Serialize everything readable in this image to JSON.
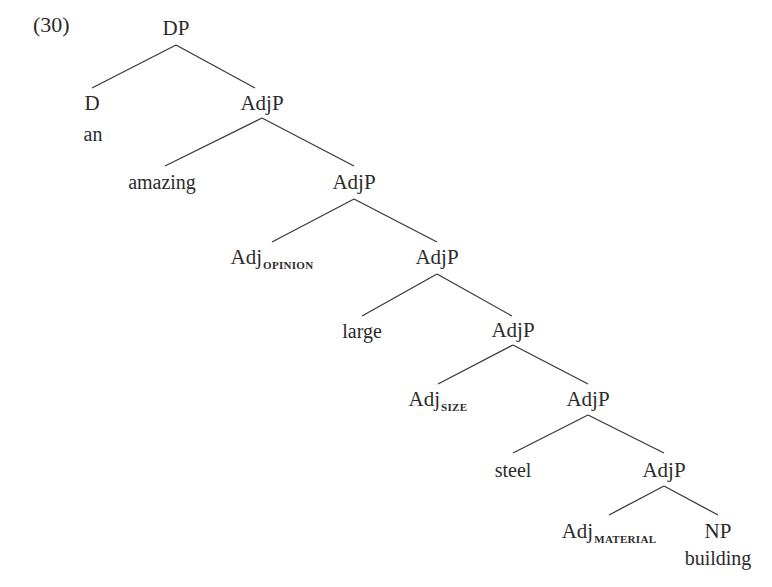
{
  "example_number": "(30)",
  "tree": {
    "nodes": {
      "dp": {
        "label": "DP"
      },
      "d": {
        "label": "D",
        "word": "an"
      },
      "adjp1": {
        "label": "AdjP"
      },
      "amazing": {
        "word": "amazing"
      },
      "adjp2": {
        "label": "AdjP"
      },
      "adj_opinion": {
        "label": "Adj",
        "subscript": "opinion"
      },
      "adjp3": {
        "label": "AdjP"
      },
      "large": {
        "word": "large"
      },
      "adjp4": {
        "label": "AdjP"
      },
      "adj_size": {
        "label": "Adj",
        "subscript": "size"
      },
      "adjp5": {
        "label": "AdjP"
      },
      "steel": {
        "word": "steel"
      },
      "adjp6": {
        "label": "AdjP"
      },
      "adj_material": {
        "label": "Adj",
        "subscript": "material"
      },
      "np": {
        "label": "NP",
        "word": "building"
      }
    },
    "edges": [
      [
        "dp",
        "d"
      ],
      [
        "dp",
        "adjp1"
      ],
      [
        "adjp1",
        "amazing"
      ],
      [
        "adjp1",
        "adjp2"
      ],
      [
        "adjp2",
        "adj_opinion"
      ],
      [
        "adjp2",
        "adjp3"
      ],
      [
        "adjp3",
        "large"
      ],
      [
        "adjp3",
        "adjp4"
      ],
      [
        "adjp4",
        "adj_size"
      ],
      [
        "adjp4",
        "adjp5"
      ],
      [
        "adjp5",
        "steel"
      ],
      [
        "adjp5",
        "adjp6"
      ],
      [
        "adjp6",
        "adj_material"
      ],
      [
        "adjp6",
        "np"
      ]
    ]
  }
}
